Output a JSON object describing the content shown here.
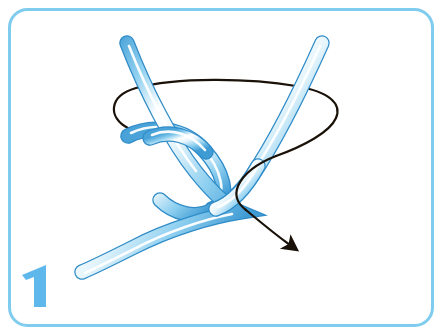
{
  "figure": {
    "kind": "knot-tying-instruction-step",
    "step_number": "1",
    "alt_text": "Step 1 of a knot: a blue cord forms a crossing bight while a thin black loop encircles it, with a curved black arrow pointing down and to the right.",
    "frame": {
      "border_color": "#7FCCEE",
      "border_width_px": 3,
      "corner_radius_px": 18,
      "background_color": "#FFFFFF"
    },
    "step_badge": {
      "label": "1",
      "color": "#5FB8EC"
    },
    "rope": {
      "edge_color": "#3F9BD4",
      "mid_color": "#8FD0F0",
      "highlight_color": "#FFFFFF",
      "outline_color": "#2F8CC8",
      "width_px": 13
    },
    "loop_line": {
      "color": "#1A1208",
      "width_px": 2.2
    },
    "arrow": {
      "color": "#1A1208",
      "width_px": 2.2,
      "head_length_px": 17,
      "direction": "down-right",
      "tip_x": 299,
      "tip_y": 252
    }
  }
}
